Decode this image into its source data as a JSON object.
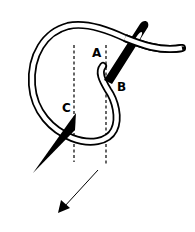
{
  "diagram": {
    "type": "embroidery-stitch-illustration",
    "labels": {
      "a": "A",
      "b": "B",
      "c": "C"
    },
    "elements": [
      "thread-loop",
      "upper-needle",
      "lower-needle",
      "guide-line-left",
      "guide-line-right",
      "direction-arrow"
    ],
    "colors": {
      "ink": "#000000",
      "background": "#ffffff"
    }
  }
}
